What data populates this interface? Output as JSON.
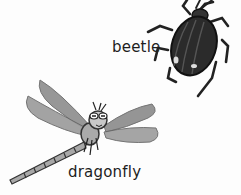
{
  "illustration": {
    "style": "grayscale hand-drawn children's illustration",
    "background_color": "#fdfdfd",
    "items": [
      {
        "name": "beetle",
        "label": "beetle",
        "body_color": "#2b2b2b"
      },
      {
        "name": "dragonfly",
        "label": "dragonfly",
        "wing_color": "#8a8a8a",
        "body_color": "#9a9a9a"
      }
    ]
  }
}
